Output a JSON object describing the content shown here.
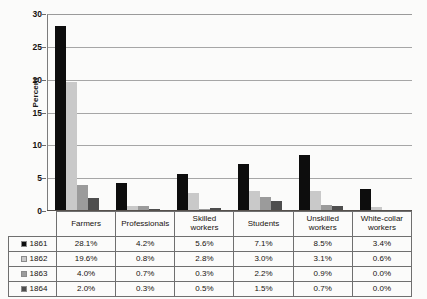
{
  "chart_data": {
    "type": "bar",
    "title": "",
    "xlabel": "",
    "ylabel": "Percent",
    "ylim": [
      0,
      30
    ],
    "yticks": [
      0,
      5,
      10,
      15,
      20,
      25,
      30
    ],
    "grid": true,
    "legend_position": "table-left",
    "categories": [
      "Farmers",
      "Professionals",
      "Skilled workers",
      "Students",
      "Unskilled workers",
      "White-collar workers"
    ],
    "series": [
      {
        "name": "1861",
        "color": "#0d0d0d",
        "values": [
          28.1,
          4.2,
          5.6,
          7.1,
          8.5,
          3.4
        ]
      },
      {
        "name": "1862",
        "color": "#c9c9c9",
        "values": [
          19.6,
          0.8,
          2.8,
          3.0,
          3.1,
          0.6
        ]
      },
      {
        "name": "1863",
        "color": "#9b9b9b",
        "values": [
          4.0,
          0.7,
          0.3,
          2.2,
          0.9,
          0.0
        ]
      },
      {
        "name": "1864",
        "color": "#4e4e4e",
        "values": [
          2.0,
          0.3,
          0.5,
          1.5,
          0.7,
          0.0
        ]
      }
    ]
  },
  "table": {
    "columns": [
      {
        "label_line1": "Farmers",
        "label_line2": ""
      },
      {
        "label_line1": "Professionals",
        "label_line2": ""
      },
      {
        "label_line1": "Skilled",
        "label_line2": "workers"
      },
      {
        "label_line1": "Students",
        "label_line2": ""
      },
      {
        "label_line1": "Unskilled",
        "label_line2": "workers"
      },
      {
        "label_line1": "White-collar",
        "label_line2": "workers"
      }
    ],
    "rows": [
      {
        "year": "1861",
        "color": "#0d0d0d",
        "cells": [
          "28.1%",
          "4.2%",
          "5.6%",
          "7.1%",
          "8.5%",
          "3.4%"
        ]
      },
      {
        "year": "1862",
        "color": "#c9c9c9",
        "cells": [
          "19.6%",
          "0.8%",
          "2.8%",
          "3.0%",
          "3.1%",
          "0.6%"
        ]
      },
      {
        "year": "1863",
        "color": "#9b9b9b",
        "cells": [
          "4.0%",
          "0.7%",
          "0.3%",
          "2.2%",
          "0.9%",
          "0.0%"
        ]
      },
      {
        "year": "1864",
        "color": "#4e4e4e",
        "cells": [
          "2.0%",
          "0.3%",
          "0.5%",
          "1.5%",
          "0.7%",
          "0.0%"
        ]
      }
    ]
  }
}
